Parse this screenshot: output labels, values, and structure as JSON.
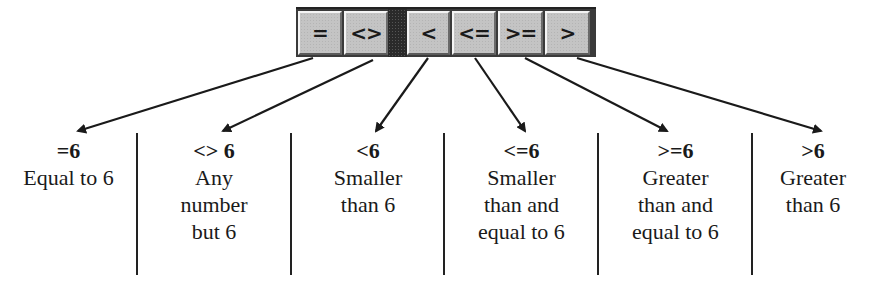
{
  "toolbar": {
    "buttons": [
      {
        "id": "eq",
        "label": "=",
        "left": 2,
        "width": 44
      },
      {
        "id": "ne",
        "label": "<>",
        "left": 48,
        "width": 44
      },
      {
        "id": "lt",
        "label": "<",
        "left": 111,
        "width": 43
      },
      {
        "id": "le",
        "label": "<=",
        "left": 156,
        "width": 44
      },
      {
        "id": "ge",
        "label": ">=",
        "left": 202,
        "width": 45
      },
      {
        "id": "gt",
        "label": ">",
        "left": 249,
        "width": 45
      }
    ]
  },
  "columns": [
    {
      "title": "=6",
      "desc": "Equal to 6"
    },
    {
      "title": "<> 6",
      "desc": "Any\nnumber\nbut 6"
    },
    {
      "title": "<6",
      "desc": "Smaller\nthan 6"
    },
    {
      "title": "<=6",
      "desc": "Smaller\nthan and\nequal to 6"
    },
    {
      "title": ">=6",
      "desc": "Greater\nthan and\nequal to 6"
    },
    {
      "title": ">6",
      "desc": "Greater\nthan 6"
    }
  ],
  "colors": {
    "button_face": "#c4c4c4",
    "separator": "#2a2a2a",
    "ink": "#1a1a1a"
  }
}
